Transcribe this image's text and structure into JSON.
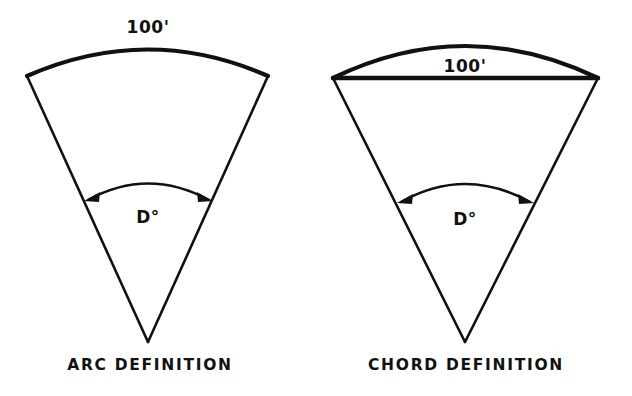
{
  "figure": {
    "background_color": "#ffffff",
    "ink_color": "#111111",
    "figures": [
      {
        "id": "arc-definition",
        "caption": "ARC DEFINITION",
        "dimension_label": "100'",
        "angle_label": "D°",
        "dimension_applies_to": "arc",
        "description": "Circular sector whose 100 foot length is measured along the curved arc",
        "geometry": {
          "apex": [
            148,
            342
          ],
          "left_endpoint": [
            27,
            76
          ],
          "right_endpoint": [
            268,
            76
          ],
          "arc_peak": [
            148,
            51
          ],
          "angle_arc_left": [
            85,
            199
          ],
          "angle_arc_right": [
            212,
            199
          ],
          "angle_arc_peak": [
            148,
            186
          ]
        },
        "label_positions": {
          "dimension": [
            148,
            33
          ],
          "angle": [
            148,
            222
          ],
          "caption": [
            150,
            369
          ]
        }
      },
      {
        "id": "chord-definition",
        "caption": "CHORD DEFINITION",
        "dimension_label": "100'",
        "angle_label": "D°",
        "dimension_applies_to": "chord",
        "description": "Circular sector whose 100 foot length is measured along the straight chord joining the arc endpoints",
        "geometry": {
          "apex": [
            465,
            342
          ],
          "left_endpoint": [
            333,
            78
          ],
          "right_endpoint": [
            598,
            78
          ],
          "arc_peak": [
            465,
            46
          ],
          "chord_left": [
            333,
            78
          ],
          "chord_right": [
            598,
            78
          ],
          "angle_arc_left": [
            398,
            201
          ],
          "angle_arc_right": [
            533,
            201
          ],
          "angle_arc_peak": [
            465,
            186
          ]
        },
        "label_positions": {
          "dimension": [
            465,
            72
          ],
          "angle": [
            465,
            224
          ],
          "caption": [
            466,
            369
          ]
        }
      }
    ]
  }
}
